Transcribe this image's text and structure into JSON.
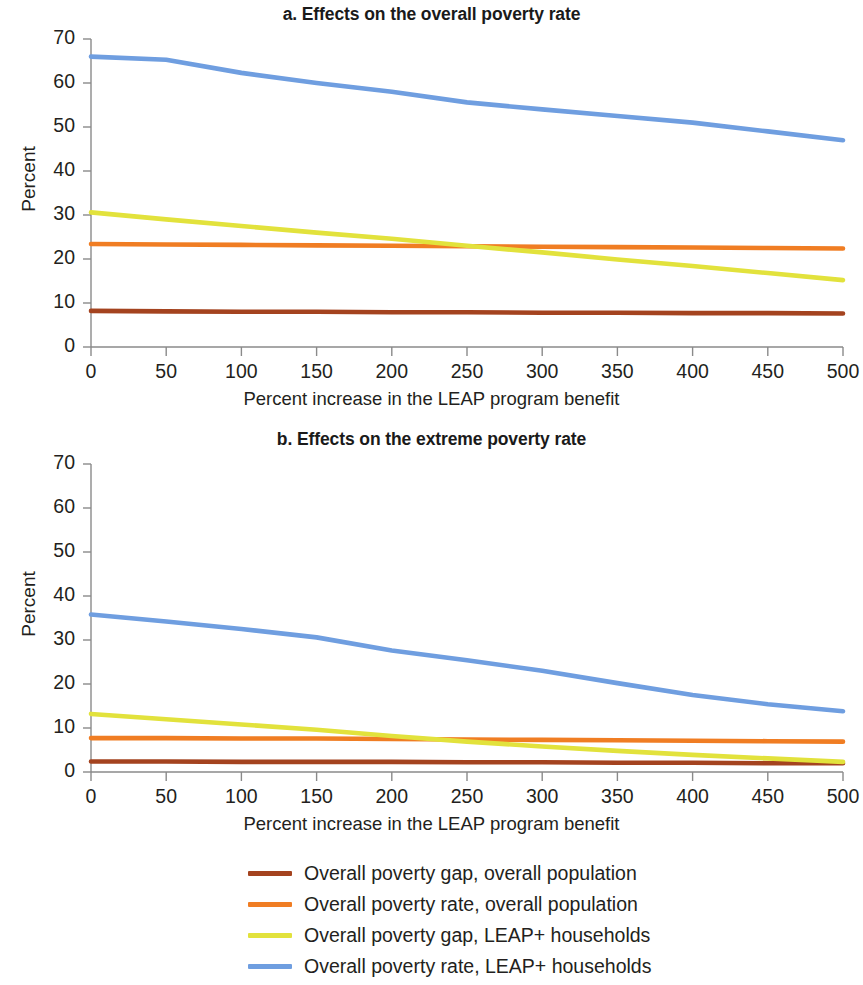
{
  "figure": {
    "panels": [
      {
        "id": "a",
        "title": "a. Effects on the overall poverty rate",
        "ylabel": "Percent",
        "xlabel": "Percent increase in the LEAP program benefit"
      },
      {
        "id": "b",
        "title": "b. Effects on the extreme poverty rate",
        "ylabel": "Percent",
        "xlabel": "Percent increase in the LEAP program benefit"
      }
    ],
    "legend": {
      "items": [
        {
          "label": "Overall poverty gap, overall population",
          "color": "#a4431f"
        },
        {
          "label": "Overall poverty rate, overall population",
          "color": "#f07d23"
        },
        {
          "label": "Overall poverty gap, LEAP+ households",
          "color": "#e2e23c"
        },
        {
          "label": "Overall poverty rate, LEAP+ households",
          "color": "#6f9ee0"
        }
      ]
    }
  },
  "chart_data": [
    {
      "type": "line",
      "title": "a. Effects on the overall poverty rate",
      "xlabel": "Percent increase in the LEAP program benefit",
      "ylabel": "Percent",
      "xlim": [
        0,
        500
      ],
      "ylim": [
        0,
        70
      ],
      "xticks": [
        0,
        50,
        100,
        150,
        200,
        250,
        300,
        350,
        400,
        450,
        500
      ],
      "yticks": [
        0,
        10,
        20,
        30,
        40,
        50,
        60,
        70
      ],
      "grid": false,
      "legend_position": "below-figure",
      "x": [
        0,
        50,
        100,
        150,
        200,
        250,
        300,
        350,
        400,
        450,
        500
      ],
      "series": [
        {
          "name": "Overall poverty gap, overall population",
          "color": "#a4431f",
          "values": [
            8.2,
            8.1,
            8.0,
            8.0,
            7.9,
            7.9,
            7.8,
            7.8,
            7.7,
            7.7,
            7.6
          ]
        },
        {
          "name": "Overall poverty rate, overall population",
          "color": "#f07d23",
          "values": [
            23.4,
            23.3,
            23.2,
            23.1,
            23.0,
            22.9,
            22.8,
            22.7,
            22.6,
            22.5,
            22.4
          ]
        },
        {
          "name": "Overall poverty gap, LEAP+ households",
          "color": "#e2e23c",
          "values": [
            30.6,
            29.0,
            27.5,
            26.0,
            24.6,
            23.0,
            21.5,
            19.9,
            18.4,
            16.8,
            15.2
          ]
        },
        {
          "name": "Overall poverty rate, LEAP+ households",
          "color": "#6f9ee0",
          "values": [
            66.0,
            65.3,
            62.3,
            60.0,
            58.0,
            55.6,
            54.0,
            52.5,
            51.0,
            49.0,
            47.0
          ]
        }
      ]
    },
    {
      "type": "line",
      "title": "b. Effects on the extreme poverty rate",
      "xlabel": "Percent increase in the LEAP program benefit",
      "ylabel": "Percent",
      "xlim": [
        0,
        500
      ],
      "ylim": [
        0,
        70
      ],
      "xticks": [
        0,
        50,
        100,
        150,
        200,
        250,
        300,
        350,
        400,
        450,
        500
      ],
      "yticks": [
        0,
        10,
        20,
        30,
        40,
        50,
        60,
        70
      ],
      "grid": false,
      "legend_position": "below-figure",
      "x": [
        0,
        50,
        100,
        150,
        200,
        250,
        300,
        350,
        400,
        450,
        500
      ],
      "series": [
        {
          "name": "Overall poverty gap, overall population",
          "color": "#a4431f",
          "values": [
            2.4,
            2.4,
            2.3,
            2.3,
            2.3,
            2.2,
            2.2,
            2.1,
            2.1,
            2.0,
            2.0
          ]
        },
        {
          "name": "Overall poverty rate, overall population",
          "color": "#f07d23",
          "values": [
            7.7,
            7.7,
            7.6,
            7.6,
            7.5,
            7.4,
            7.3,
            7.2,
            7.1,
            7.0,
            6.9
          ]
        },
        {
          "name": "Overall poverty gap, LEAP+ households",
          "color": "#e2e23c",
          "values": [
            13.2,
            12.0,
            10.8,
            9.6,
            8.2,
            6.9,
            5.8,
            4.8,
            3.9,
            3.1,
            2.3
          ]
        },
        {
          "name": "Overall poverty rate, LEAP+ households",
          "color": "#6f9ee0",
          "values": [
            35.8,
            34.2,
            32.5,
            30.6,
            27.6,
            25.4,
            23.0,
            20.2,
            17.5,
            15.4,
            13.8
          ]
        }
      ]
    }
  ]
}
